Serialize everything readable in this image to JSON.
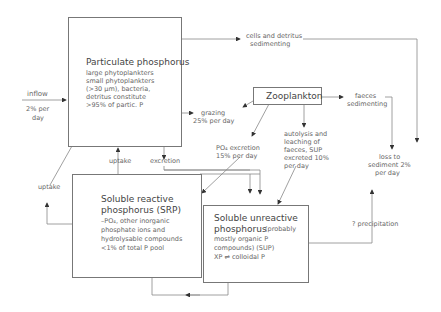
{
  "nodes": {
    "particulate": {
      "title": "Particulate phosphorus",
      "lines": [
        "large phytoplankters",
        "small phytoplankters",
        "(>30 µm), bacteria,",
        "detritus constitute",
        ">95% of partic. P"
      ]
    },
    "zooplankton": {
      "title": "Zooplankton"
    },
    "srp": {
      "title1": "Soluble reactive",
      "title2": "phosphorus (SRP)",
      "lines": [
        "–PO₄, other inorganic",
        "phosphate ions and",
        "hydrolysable compounds",
        "<1% of total P pool"
      ]
    },
    "sup": {
      "title1": "Soluble unreactive",
      "title2": "phosphorus",
      "title2_suffix": "(probably",
      "lines": [
        "mostly organic P",
        "compounds) (SUP)",
        "XP ⇌ colloidal P"
      ]
    }
  },
  "labels": {
    "inflow": "inflow",
    "inflow_rate1": "2% per",
    "inflow_rate2": "day",
    "cells_sedimenting1": "cells and detritus",
    "cells_sedimenting2": "sedimenting",
    "grazing1": "grazing",
    "grazing2": "25% per day",
    "faeces1": "faeces",
    "faeces2": "sedimenting",
    "po4_excretion1": "PO₄ excretion",
    "po4_excretion2": "15% per day",
    "autolysis1": "autolysis and",
    "autolysis2": "leaching of",
    "autolysis3": "faeces, SUP",
    "autolysis4": "excreted 10%",
    "autolysis5": "per day",
    "loss1": "loss to",
    "loss2": "sediment 2%",
    "loss3": "per day",
    "uptake_left": "uptake",
    "uptake_mid": "uptake",
    "excretion": "excretion",
    "precipitation": "? precipitation"
  }
}
